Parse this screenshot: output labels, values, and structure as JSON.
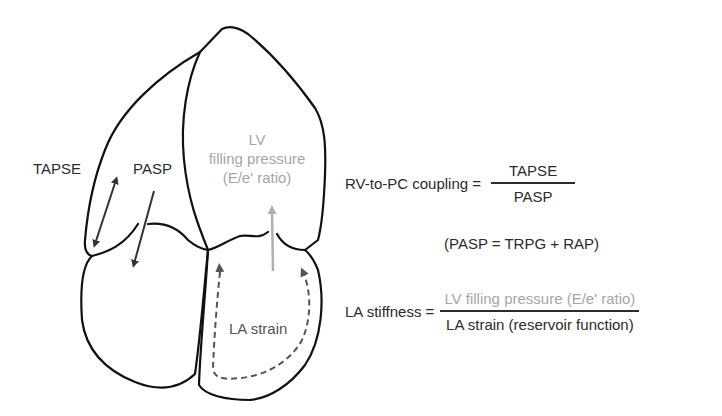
{
  "heart_labels": {
    "tapse": "TAPSE",
    "pasp": "PASP",
    "lv_line1": "LV",
    "lv_line2": "filling pressure",
    "lv_line3": "(E/e' ratio)",
    "la_strain": "LA strain"
  },
  "equations": {
    "rv_pc": {
      "lhs": "RV-to-PC coupling =",
      "numerator": "TAPSE",
      "denominator": "PASP"
    },
    "pasp_def": "(PASP = TRPG + RAP)",
    "la_stiffness": {
      "lhs": "LA stiffness =",
      "numerator": "LV filling pressure (E/e' ratio)",
      "denominator": "LA strain (reservoir function)"
    }
  },
  "colors": {
    "outline": "#111111",
    "dark_arrow": "#333333",
    "grey_text": "#a6a6a6",
    "dashed_arrow": "#555555"
  }
}
